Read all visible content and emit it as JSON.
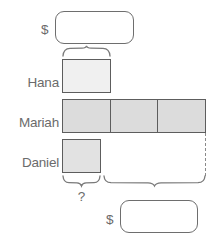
{
  "diagram": {
    "type": "tape-diagram",
    "total_top": {
      "currency_symbol": "$",
      "value": ""
    },
    "total_bottom": {
      "currency_symbol": "$",
      "value": ""
    },
    "unknown_marker": "?",
    "rows": [
      {
        "label": "Hana",
        "segments": 1,
        "fill": "#f0f0f0",
        "units": 1
      },
      {
        "label": "Mariah",
        "segments": 3,
        "fill": "#dcdcdc",
        "units": 3
      },
      {
        "label": "Daniel",
        "segments": 1,
        "fill": "#e2e2e2",
        "units": 1
      }
    ],
    "braces": [
      {
        "name": "hana-unit-brace",
        "spans": "Hana bar",
        "label": ""
      },
      {
        "name": "daniel-unknown-brace",
        "spans": "Daniel bar",
        "label": "?"
      },
      {
        "name": "mariah-remainder-brace",
        "spans": "Mariah remainder",
        "label": ""
      }
    ],
    "colors": {
      "outline": "#5d5d5d",
      "box_outline": "#6e6e6e",
      "text": "#6b6b6b",
      "hana_fill": "#f0f0f0",
      "mariah_fill": "#dcdcdc",
      "daniel_fill": "#e2e2e2",
      "dashed": "#8a8a8a",
      "background": "#ffffff"
    }
  }
}
